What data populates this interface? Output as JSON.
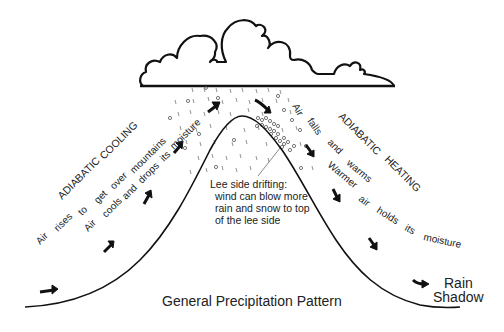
{
  "diagram": {
    "title": "General Precipitation Pattern",
    "windward": {
      "heading": [
        "ADIABATIC",
        "COOLING"
      ],
      "line1": [
        "Air",
        "rises",
        "to",
        "get",
        "over",
        "mountains"
      ],
      "line2": [
        "Air",
        "cools",
        "and",
        "drops",
        "its",
        "moisture"
      ]
    },
    "leeward": {
      "heading": [
        "ADIABATIC",
        "HEATING"
      ],
      "line1": [
        "Air",
        "falls",
        "and",
        "warms"
      ],
      "line2": [
        "Warmer",
        "air",
        "holds",
        "its",
        "moisture"
      ],
      "rain_shadow": [
        "Rain",
        "Shadow"
      ]
    },
    "lee_note": [
      "Lee side drifting:",
      "wind can blow more",
      "rain and snow to top",
      "of the lee side"
    ],
    "icons": [
      "cloud-icon",
      "mountain-profile",
      "wind-arrow-icon",
      "rain-dashes",
      "snow-circles"
    ]
  }
}
